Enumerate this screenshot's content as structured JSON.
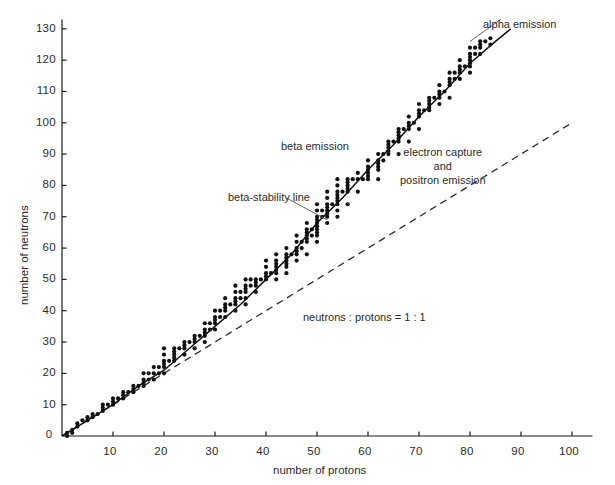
{
  "chart_data": {
    "type": "scatter",
    "title": "",
    "xlabel": "number of protons",
    "ylabel": "number of neutrons",
    "xlim": [
      0,
      104
    ],
    "ylim": [
      0,
      133
    ],
    "xticks": [
      0,
      10,
      20,
      30,
      40,
      50,
      60,
      70,
      80,
      90,
      100
    ],
    "yticks": [
      0,
      10,
      20,
      30,
      40,
      50,
      60,
      70,
      80,
      90,
      100,
      110,
      120,
      130
    ],
    "xtick_labels": [
      "0",
      "10",
      "20",
      "30",
      "40",
      "50",
      "60",
      "70",
      "80",
      "90",
      "100"
    ],
    "ytick_labels": [
      "0",
      "10",
      "20",
      "30",
      "40",
      "50",
      "60",
      "70",
      "80",
      "90",
      "100",
      "110",
      "120",
      "130"
    ],
    "grid": false,
    "legend_position": "none",
    "marker_color": "#111111",
    "line_color": "#111111",
    "axis_color": "#1a1a1a",
    "series": [
      {
        "name": "stable nuclides",
        "type": "scatter",
        "marker": "filled-circle",
        "points": [
          [
            1,
            0
          ],
          [
            1,
            1
          ],
          [
            2,
            1
          ],
          [
            2,
            2
          ],
          [
            3,
            3
          ],
          [
            3,
            4
          ],
          [
            4,
            5
          ],
          [
            5,
            5
          ],
          [
            5,
            6
          ],
          [
            6,
            6
          ],
          [
            6,
            7
          ],
          [
            7,
            7
          ],
          [
            8,
            8
          ],
          [
            8,
            9
          ],
          [
            8,
            10
          ],
          [
            9,
            10
          ],
          [
            10,
            10
          ],
          [
            10,
            11
          ],
          [
            10,
            12
          ],
          [
            11,
            12
          ],
          [
            12,
            12
          ],
          [
            12,
            13
          ],
          [
            12,
            14
          ],
          [
            13,
            14
          ],
          [
            14,
            14
          ],
          [
            14,
            15
          ],
          [
            14,
            16
          ],
          [
            15,
            16
          ],
          [
            16,
            16
          ],
          [
            16,
            17
          ],
          [
            16,
            18
          ],
          [
            16,
            20
          ],
          [
            17,
            18
          ],
          [
            17,
            20
          ],
          [
            18,
            18
          ],
          [
            18,
            20
          ],
          [
            18,
            22
          ],
          [
            19,
            20
          ],
          [
            19,
            22
          ],
          [
            20,
            20
          ],
          [
            20,
            22
          ],
          [
            20,
            23
          ],
          [
            20,
            24
          ],
          [
            20,
            26
          ],
          [
            20,
            28
          ],
          [
            21,
            24
          ],
          [
            22,
            24
          ],
          [
            22,
            25
          ],
          [
            22,
            26
          ],
          [
            22,
            27
          ],
          [
            22,
            28
          ],
          [
            23,
            28
          ],
          [
            24,
            26
          ],
          [
            24,
            28
          ],
          [
            24,
            29
          ],
          [
            24,
            30
          ],
          [
            25,
            30
          ],
          [
            26,
            28
          ],
          [
            26,
            30
          ],
          [
            26,
            31
          ],
          [
            26,
            32
          ],
          [
            27,
            32
          ],
          [
            28,
            30
          ],
          [
            28,
            32
          ],
          [
            28,
            33
          ],
          [
            28,
            34
          ],
          [
            28,
            36
          ],
          [
            29,
            34
          ],
          [
            29,
            36
          ],
          [
            30,
            34
          ],
          [
            30,
            36
          ],
          [
            30,
            37
          ],
          [
            30,
            38
          ],
          [
            30,
            40
          ],
          [
            31,
            38
          ],
          [
            31,
            40
          ],
          [
            32,
            38
          ],
          [
            32,
            40
          ],
          [
            32,
            41
          ],
          [
            32,
            42
          ],
          [
            32,
            44
          ],
          [
            33,
            42
          ],
          [
            34,
            40
          ],
          [
            34,
            42
          ],
          [
            34,
            43
          ],
          [
            34,
            44
          ],
          [
            34,
            46
          ],
          [
            34,
            48
          ],
          [
            35,
            44
          ],
          [
            35,
            46
          ],
          [
            36,
            42
          ],
          [
            36,
            44
          ],
          [
            36,
            46
          ],
          [
            36,
            47
          ],
          [
            36,
            48
          ],
          [
            36,
            50
          ],
          [
            37,
            48
          ],
          [
            37,
            50
          ],
          [
            38,
            46
          ],
          [
            38,
            48
          ],
          [
            38,
            49
          ],
          [
            38,
            50
          ],
          [
            39,
            50
          ],
          [
            40,
            50
          ],
          [
            40,
            51
          ],
          [
            40,
            52
          ],
          [
            40,
            54
          ],
          [
            40,
            56
          ],
          [
            41,
            52
          ],
          [
            42,
            50
          ],
          [
            42,
            52
          ],
          [
            42,
            53
          ],
          [
            42,
            54
          ],
          [
            42,
            55
          ],
          [
            42,
            56
          ],
          [
            42,
            58
          ],
          [
            44,
            52
          ],
          [
            44,
            54
          ],
          [
            44,
            55
          ],
          [
            44,
            56
          ],
          [
            44,
            57
          ],
          [
            44,
            58
          ],
          [
            44,
            60
          ],
          [
            45,
            58
          ],
          [
            46,
            56
          ],
          [
            46,
            58
          ],
          [
            46,
            59
          ],
          [
            46,
            60
          ],
          [
            46,
            62
          ],
          [
            46,
            64
          ],
          [
            47,
            60
          ],
          [
            47,
            62
          ],
          [
            48,
            58
          ],
          [
            48,
            62
          ],
          [
            48,
            63
          ],
          [
            48,
            64
          ],
          [
            48,
            65
          ],
          [
            48,
            66
          ],
          [
            48,
            68
          ],
          [
            49,
            64
          ],
          [
            49,
            66
          ],
          [
            50,
            62
          ],
          [
            50,
            64
          ],
          [
            50,
            65
          ],
          [
            50,
            66
          ],
          [
            50,
            67
          ],
          [
            50,
            68
          ],
          [
            50,
            69
          ],
          [
            50,
            70
          ],
          [
            50,
            72
          ],
          [
            50,
            74
          ],
          [
            51,
            70
          ],
          [
            51,
            72
          ],
          [
            52,
            68
          ],
          [
            52,
            70
          ],
          [
            52,
            71
          ],
          [
            52,
            72
          ],
          [
            52,
            73
          ],
          [
            52,
            74
          ],
          [
            52,
            76
          ],
          [
            52,
            78
          ],
          [
            53,
            74
          ],
          [
            54,
            70
          ],
          [
            54,
            72
          ],
          [
            54,
            74
          ],
          [
            54,
            75
          ],
          [
            54,
            76
          ],
          [
            54,
            77
          ],
          [
            54,
            78
          ],
          [
            54,
            80
          ],
          [
            54,
            82
          ],
          [
            55,
            78
          ],
          [
            56,
            74
          ],
          [
            56,
            78
          ],
          [
            56,
            79
          ],
          [
            56,
            80
          ],
          [
            56,
            81
          ],
          [
            56,
            82
          ],
          [
            57,
            82
          ],
          [
            58,
            78
          ],
          [
            58,
            82
          ],
          [
            58,
            84
          ],
          [
            59,
            82
          ],
          [
            60,
            82
          ],
          [
            60,
            83
          ],
          [
            60,
            84
          ],
          [
            60,
            85
          ],
          [
            60,
            86
          ],
          [
            60,
            88
          ],
          [
            62,
            82
          ],
          [
            62,
            85
          ],
          [
            62,
            86
          ],
          [
            62,
            87
          ],
          [
            62,
            88
          ],
          [
            62,
            90
          ],
          [
            63,
            88
          ],
          [
            63,
            90
          ],
          [
            64,
            90
          ],
          [
            64,
            91
          ],
          [
            64,
            92
          ],
          [
            64,
            93
          ],
          [
            64,
            94
          ],
          [
            65,
            94
          ],
          [
            66,
            90
          ],
          [
            66,
            94
          ],
          [
            66,
            95
          ],
          [
            66,
            96
          ],
          [
            66,
            97
          ],
          [
            66,
            98
          ],
          [
            67,
            98
          ],
          [
            68,
            94
          ],
          [
            68,
            98
          ],
          [
            68,
            99
          ],
          [
            68,
            100
          ],
          [
            68,
            102
          ],
          [
            69,
            100
          ],
          [
            70,
            98
          ],
          [
            70,
            102
          ],
          [
            70,
            103
          ],
          [
            70,
            104
          ],
          [
            70,
            106
          ],
          [
            71,
            104
          ],
          [
            72,
            104
          ],
          [
            72,
            105
          ],
          [
            72,
            106
          ],
          [
            72,
            107
          ],
          [
            72,
            108
          ],
          [
            73,
            108
          ],
          [
            74,
            106
          ],
          [
            74,
            108
          ],
          [
            74,
            109
          ],
          [
            74,
            110
          ],
          [
            74,
            112
          ],
          [
            75,
            110
          ],
          [
            76,
            108
          ],
          [
            76,
            112
          ],
          [
            76,
            113
          ],
          [
            76,
            114
          ],
          [
            76,
            116
          ],
          [
            77,
            114
          ],
          [
            77,
            116
          ],
          [
            78,
            114
          ],
          [
            78,
            116
          ],
          [
            78,
            117
          ],
          [
            78,
            118
          ],
          [
            78,
            120
          ],
          [
            79,
            118
          ],
          [
            80,
            116
          ],
          [
            80,
            118
          ],
          [
            80,
            119
          ],
          [
            80,
            120
          ],
          [
            80,
            121
          ],
          [
            80,
            122
          ],
          [
            80,
            124
          ],
          [
            81,
            122
          ],
          [
            81,
            124
          ],
          [
            82,
            122
          ],
          [
            82,
            124
          ],
          [
            82,
            125
          ],
          [
            82,
            126
          ],
          [
            83,
            126
          ],
          [
            84,
            125
          ],
          [
            84,
            127
          ]
        ]
      }
    ],
    "lines": [
      {
        "name": "beta-stability line",
        "style": "solid",
        "color": "#111111",
        "description": "smooth curve through the band of stable nuclides, rising above the 1:1 line as Z increases",
        "points": [
          [
            0,
            0
          ],
          [
            5,
            5
          ],
          [
            10,
            10
          ],
          [
            15,
            16
          ],
          [
            20,
            21
          ],
          [
            25,
            28
          ],
          [
            30,
            35
          ],
          [
            35,
            42
          ],
          [
            40,
            50
          ],
          [
            45,
            58
          ],
          [
            50,
            68
          ],
          [
            55,
            76
          ],
          [
            60,
            85
          ],
          [
            65,
            93
          ],
          [
            70,
            102
          ],
          [
            75,
            110
          ],
          [
            80,
            119
          ],
          [
            85,
            126
          ],
          [
            88,
            130
          ]
        ]
      },
      {
        "name": "neutrons : protons = 1 : 1",
        "style": "dashed",
        "color": "#2b2b2b",
        "description": "straight reference line of slope 1 from origin",
        "points": [
          [
            0,
            0
          ],
          [
            100,
            100
          ]
        ]
      }
    ],
    "annotations": [
      {
        "id": "alpha-emission",
        "text": "alpha emission",
        "lines": [
          "alpha emission"
        ],
        "align": "left",
        "leader": true,
        "leader_from": [
          80,
          126
        ],
        "leader_to": [
          86,
          133
        ]
      },
      {
        "id": "beta-emission",
        "text": "beta emission",
        "lines": [
          "beta emission"
        ],
        "align": "left",
        "leader": false
      },
      {
        "id": "electron-capture-positron",
        "text": "electron capture and positron emission",
        "lines": [
          "electron capture",
          "and",
          "positron emission"
        ],
        "align": "center",
        "leader": false
      },
      {
        "id": "beta-stability-line",
        "text": "beta-stability line",
        "lines": [
          "beta-stability line"
        ],
        "align": "left",
        "leader": true,
        "leader_from": [
          44,
          76
        ],
        "leader_to": [
          52,
          69
        ]
      },
      {
        "id": "neutrons-protons-ratio",
        "text": "neutrons : protons = 1 : 1",
        "lines": [
          "neutrons : protons = 1 : 1"
        ],
        "align": "left",
        "leader": false
      }
    ]
  }
}
